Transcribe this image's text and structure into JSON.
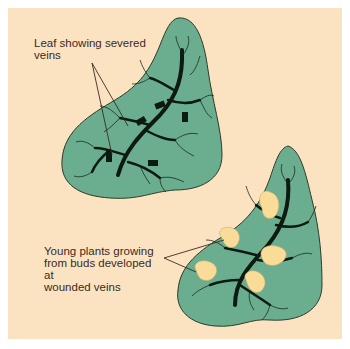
{
  "figure": {
    "background_color": "#fbe3c2",
    "leaf_color": "#6aae8f",
    "vein_color": "#0d1a12",
    "bud_color": "#f8dc98",
    "labels": {
      "severed_veins": "Leaf showing severed\nveins",
      "young_plants": "Young plants growing\nfrom buds developed at\nwounded veins"
    },
    "elements": [
      {
        "name": "leaf-with-severed-veins",
        "position": "upper-left"
      },
      {
        "name": "leaf-with-young-plants",
        "position": "lower-right"
      }
    ]
  }
}
